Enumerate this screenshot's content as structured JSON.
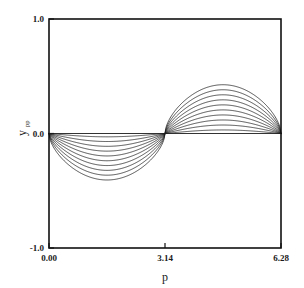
{
  "chart_data": {
    "type": "line",
    "title": "",
    "xlabel": "p",
    "ylabel": "y_pp",
    "ylabel_base": "y",
    "ylabel_sub": "pp",
    "xlim": [
      0.0,
      6.28
    ],
    "ylim": [
      -1.0,
      1.0
    ],
    "grid": false,
    "legend": "none",
    "x_ticks": [
      0.0,
      3.14,
      6.28
    ],
    "x_tick_labels": [
      "0.00",
      "3.14",
      "6.28"
    ],
    "y_ticks": [
      -1.0,
      0.0,
      1.0
    ],
    "y_tick_labels": [
      "-1.0",
      "0.0",
      "1.0"
    ],
    "node_x": 3.14,
    "series": [
      {
        "name": "curve-1",
        "amplitude": 0.03,
        "neg_min": -0.029,
        "pos_max": 0.031
      },
      {
        "name": "curve-2",
        "amplitude": 0.072,
        "neg_min": -0.07,
        "pos_max": 0.074
      },
      {
        "name": "curve-3",
        "amplitude": 0.115,
        "neg_min": -0.112,
        "pos_max": 0.118
      },
      {
        "name": "curve-4",
        "amplitude": 0.158,
        "neg_min": -0.154,
        "pos_max": 0.162
      },
      {
        "name": "curve-5",
        "amplitude": 0.201,
        "neg_min": -0.196,
        "pos_max": 0.206
      },
      {
        "name": "curve-6",
        "amplitude": 0.244,
        "neg_min": -0.238,
        "pos_max": 0.25
      },
      {
        "name": "curve-7",
        "amplitude": 0.287,
        "neg_min": -0.28,
        "pos_max": 0.294
      },
      {
        "name": "curve-8",
        "amplitude": 0.33,
        "neg_min": -0.322,
        "pos_max": 0.338
      },
      {
        "name": "curve-9",
        "amplitude": 0.373,
        "neg_min": -0.364,
        "pos_max": 0.382
      },
      {
        "name": "curve-10",
        "amplitude": 0.416,
        "neg_min": -0.406,
        "pos_max": 0.426
      }
    ],
    "x_samples": [
      0.0,
      0.157,
      0.314,
      0.471,
      0.628,
      0.785,
      0.942,
      1.099,
      1.256,
      1.413,
      1.57,
      1.727,
      1.884,
      2.041,
      2.198,
      2.355,
      2.512,
      2.669,
      2.826,
      2.983,
      3.14,
      3.297,
      3.454,
      3.611,
      3.768,
      3.925,
      4.082,
      4.239,
      4.396,
      4.553,
      4.71,
      4.867,
      5.024,
      5.181,
      5.338,
      5.495,
      5.652,
      5.809,
      5.966,
      6.123,
      6.28
    ]
  },
  "geometry": {
    "plot_left": 49,
    "plot_right": 281,
    "plot_top": 19,
    "plot_bottom": 248
  },
  "colors": {
    "curve": "#1c1c1c",
    "frame": "#111111",
    "text": "#1a1a1a",
    "background": "#ffffff"
  }
}
